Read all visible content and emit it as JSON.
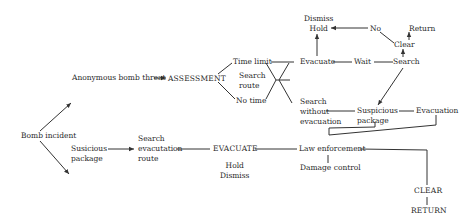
{
  "diagram": {
    "type": "flowchart",
    "colors": {
      "line": "#333333",
      "text": "#2a2a2a",
      "background": "#ffffff"
    },
    "nodes": {
      "bomb_incident": "Bomb incident",
      "anonymous_threat": "Anonymous bomb threat",
      "assessment": "ASSESSMENT",
      "time_limit": "Time limit",
      "search_route": [
        "Search",
        "route"
      ],
      "no_time": "No time",
      "evacuate": "Evacuate",
      "dismiss_hold_top": [
        "Dismiss",
        "Hold"
      ],
      "no": "No",
      "clear_top": "Clear",
      "return_top": "Return",
      "wait": "Wait",
      "search_top": "Search",
      "search_without_evac": [
        "Search",
        "without",
        "evacuation"
      ],
      "suspicious_package_top": [
        "Suspicious",
        "package"
      ],
      "evacuation": "Evacuation",
      "susicious_package": [
        "Susicious",
        "package"
      ],
      "search_evac_route": [
        "Search",
        "evacutation",
        "route"
      ],
      "evacuate_caps": "EVACUATE",
      "hold_dismiss": [
        "Hold",
        "Dismiss"
      ],
      "law_enforcement": "Law enforcement",
      "damage_control": "Damage control",
      "clear_caps": "CLEAR",
      "return_caps": "RETURN"
    },
    "edges": [
      [
        "Bomb incident",
        "Anonymous bomb threat"
      ],
      [
        "Bomb incident",
        "Susicious package"
      ],
      [
        "Anonymous bomb threat",
        "ASSESSMENT"
      ],
      [
        "ASSESSMENT",
        "Time limit"
      ],
      [
        "ASSESSMENT",
        "No time"
      ],
      [
        "Time limit",
        "Evacuate"
      ],
      [
        "No time",
        "Search without evacuation"
      ],
      [
        "Evacuate",
        "Dismiss Hold"
      ],
      [
        "No",
        "Dismiss Hold"
      ],
      [
        "Clear",
        "No"
      ],
      [
        "Clear",
        "Return"
      ],
      [
        "Search",
        "Clear"
      ],
      [
        "Evacuate",
        "Wait"
      ],
      [
        "Wait",
        "Search"
      ],
      [
        "Search",
        "Suspicious package"
      ],
      [
        "Search without evacuation",
        "Suspicious package"
      ],
      [
        "Suspicious package",
        "Evacuation"
      ],
      [
        "Suspicious package",
        "Law enforcement"
      ],
      [
        "Evacuation",
        "Law enforcement"
      ],
      [
        "Susicious package",
        "Search evacutation route"
      ],
      [
        "Search evacutation route",
        "EVACUATE"
      ],
      [
        "EVACUATE",
        "Law enforcement"
      ],
      [
        "Law enforcement",
        "Damage control"
      ],
      [
        "Law enforcement",
        "CLEAR"
      ],
      [
        "CLEAR",
        "RETURN"
      ]
    ]
  }
}
